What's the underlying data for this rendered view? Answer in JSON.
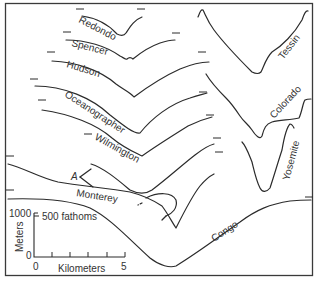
{
  "figure": {
    "colors": {
      "line": "#2b2b2b",
      "text": "#333333",
      "background": "#ffffff"
    },
    "canyons": [
      {
        "name": "Redondo"
      },
      {
        "name": "Spencer"
      },
      {
        "name": "Hudson"
      },
      {
        "name": "Oceanographer"
      },
      {
        "name": "Wilmington"
      },
      {
        "name": "Monterey"
      },
      {
        "name": "Congo"
      },
      {
        "name": "Tessin"
      },
      {
        "name": "Colorado"
      },
      {
        "name": "Yosemite"
      }
    ],
    "annotation": {
      "label": "A"
    },
    "scale": {
      "vertical_label": "Meters",
      "vertical_top": "1000",
      "vertical_bottom": "0",
      "fathoms_label": "500 fathoms",
      "horizontal_label": "Kilometers",
      "horizontal_left": "0",
      "horizontal_right": "5"
    }
  }
}
